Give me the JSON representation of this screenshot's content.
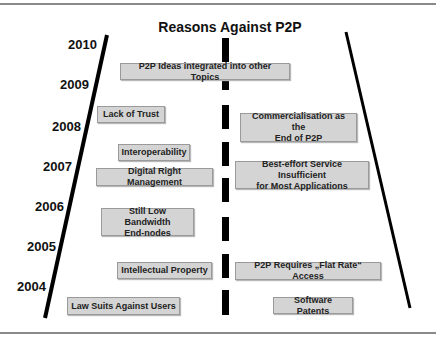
{
  "title": "Reasons Against P2P",
  "years": [
    "2010",
    "2009",
    "2008",
    "2007",
    "2006",
    "2005",
    "2004"
  ],
  "left_reasons": [
    {
      "label": "P2P Ideas integrated into other Topics"
    },
    {
      "label": "Lack of Trust"
    },
    {
      "label": "Interoperability"
    },
    {
      "label": "Digital Right Management"
    },
    {
      "label": "Still Low Bandwidth\nEnd-nodes"
    },
    {
      "label": "Intellectual Property"
    },
    {
      "label": "Law Suits Against Users"
    }
  ],
  "right_reasons": [
    {
      "label": "Commercialisation as the\nEnd of P2P"
    },
    {
      "label": "Best-effort Service Insufficient\nfor Most Applications"
    },
    {
      "label": "P2P Requires „Flat Rate“ Access"
    },
    {
      "label": "Software Patents"
    }
  ],
  "colors": {
    "box_fill": "#d4d4d4",
    "box_border": "#9a9a9a",
    "line": "#000000",
    "rule": "#8a8a8a"
  }
}
